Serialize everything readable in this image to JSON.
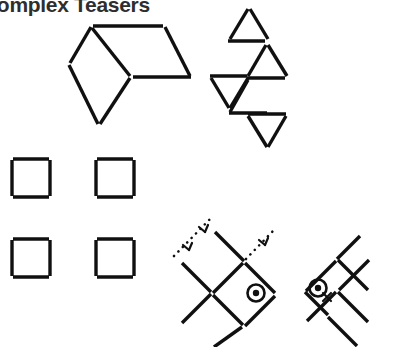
{
  "page": {
    "title": "Complex Teasers",
    "title_visible_fragment": "mplex Teasers",
    "background_color": "#ffffff",
    "ink_color": "#101010",
    "title_color": "#2e2e2e",
    "width": 397,
    "height": 347
  },
  "figures": [
    {
      "id": "figure-hexagon-diamond",
      "name": "matchstick-hexagon-diamond",
      "description": "Two adjoining rhombi forming a hexagon-like outline made of 7 matchsticks",
      "stick_count": 7,
      "sticks": [
        {
          "name": "top-horizontal",
          "x1": 93,
          "y1": 26,
          "x2": 163,
          "y2": 26
        },
        {
          "name": "upper-left-diagonal",
          "x1": 70,
          "y1": 63,
          "x2": 91,
          "y2": 27
        },
        {
          "name": "center-diagonal",
          "x1": 92,
          "y1": 28,
          "x2": 130,
          "y2": 76
        },
        {
          "name": "upper-right-diagonal",
          "x1": 165,
          "y1": 27,
          "x2": 190,
          "y2": 76
        },
        {
          "name": "middle-horizontal",
          "x1": 133,
          "y1": 77,
          "x2": 191,
          "y2": 77
        },
        {
          "name": "lower-left-diagonal",
          "x1": 69,
          "y1": 65,
          "x2": 98,
          "y2": 124
        },
        {
          "name": "lower-right-diagonal",
          "x1": 130,
          "y1": 78,
          "x2": 100,
          "y2": 124
        }
      ]
    },
    {
      "id": "figure-triangle-zigzag",
      "name": "matchstick-triangle-zigzag",
      "description": "Five triangles arranged in a descending zigzag chain",
      "triangle_count": 5,
      "sticks": [
        {
          "name": "t1-left",
          "x1": 230,
          "y1": 39,
          "x2": 248,
          "y2": 9
        },
        {
          "name": "t1-right",
          "x1": 250,
          "y1": 9,
          "x2": 268,
          "y2": 39
        },
        {
          "name": "t1-base",
          "x1": 228,
          "y1": 41,
          "x2": 265,
          "y2": 41
        },
        {
          "name": "t2-left",
          "x1": 248,
          "y1": 76,
          "x2": 266,
          "y2": 45
        },
        {
          "name": "t2-right",
          "x1": 268,
          "y1": 45,
          "x2": 287,
          "y2": 76
        },
        {
          "name": "t2-base",
          "x1": 247,
          "y1": 78,
          "x2": 285,
          "y2": 78
        },
        {
          "name": "t3-base",
          "x1": 210,
          "y1": 76,
          "x2": 248,
          "y2": 76
        },
        {
          "name": "t3-left",
          "x1": 211,
          "y1": 78,
          "x2": 229,
          "y2": 108
        },
        {
          "name": "t3-right",
          "x1": 248,
          "y1": 78,
          "x2": 230,
          "y2": 108
        },
        {
          "name": "t4-left",
          "x1": 230,
          "y1": 112,
          "x2": 248,
          "y2": 80
        },
        {
          "name": "t4-base",
          "x1": 229,
          "y1": 113,
          "x2": 267,
          "y2": 113
        },
        {
          "name": "t5-left",
          "x1": 248,
          "y1": 116,
          "x2": 267,
          "y2": 147
        },
        {
          "name": "t5-right",
          "x1": 286,
          "y1": 116,
          "x2": 268,
          "y2": 147
        },
        {
          "name": "t5-base",
          "x1": 248,
          "y1": 114,
          "x2": 286,
          "y2": 114
        }
      ]
    },
    {
      "id": "figure-four-squares",
      "name": "matchstick-four-squares",
      "description": "Four separate squares, each built from 4 matchsticks with small corner gaps",
      "square_count": 4,
      "stick_count": 16,
      "squares": [
        {
          "name": "square-top-left",
          "x": 12,
          "y": 158,
          "size": 38
        },
        {
          "name": "square-top-right",
          "x": 96,
          "y": 158,
          "size": 38
        },
        {
          "name": "square-bottom-left",
          "x": 12,
          "y": 238,
          "size": 38
        },
        {
          "name": "square-bottom-right",
          "x": 96,
          "y": 238,
          "size": 38
        }
      ]
    },
    {
      "id": "figure-lattice-dotted",
      "name": "matchstick-lattice-with-dotted-guides",
      "description": "Diagonal matchstick lattice with dotted construction guide lines, arrow ticks and a circled target marker",
      "sticks": [
        {
          "name": "guide-anchor-a",
          "x1": 182,
          "y1": 263,
          "x2": 212,
          "y2": 292
        },
        {
          "name": "lattice-1",
          "x1": 213,
          "y1": 294,
          "x2": 243,
          "y2": 264
        },
        {
          "name": "lattice-2",
          "x1": 245,
          "y1": 263,
          "x2": 275,
          "y2": 293
        },
        {
          "name": "lattice-3",
          "x1": 244,
          "y1": 262,
          "x2": 214,
          "y2": 232
        },
        {
          "name": "lattice-4",
          "x1": 212,
          "y1": 294,
          "x2": 182,
          "y2": 324
        },
        {
          "name": "lattice-5",
          "x1": 213,
          "y1": 295,
          "x2": 243,
          "y2": 325
        },
        {
          "name": "lattice-6",
          "x1": 245,
          "y1": 327,
          "x2": 275,
          "y2": 297
        },
        {
          "name": "lattice-7",
          "x1": 243,
          "y1": 327,
          "x2": 213,
          "y2": 347
        }
      ],
      "dotted_guides": [
        {
          "name": "guide-dotted-upper",
          "x1": 174,
          "y1": 255,
          "x2": 212,
          "y2": 217
        },
        {
          "name": "guide-dotted-right",
          "x1": 246,
          "y1": 258,
          "x2": 272,
          "y2": 232
        }
      ],
      "markers": [
        {
          "name": "target-marker",
          "cx": 256,
          "cy": 293,
          "r": 8.5,
          "dot_r": 3.2
        },
        {
          "name": "tick-arrow-left",
          "x": 186,
          "y": 247
        },
        {
          "name": "tick-arrow-mid",
          "x": 203,
          "y": 229
        },
        {
          "name": "tick-arrow-right",
          "x": 262,
          "y": 242
        }
      ]
    },
    {
      "id": "figure-lattice-plain",
      "name": "matchstick-lattice-with-marker",
      "description": "Diagonal matchstick lattice with a circled target marker carrying a small x tick",
      "sticks": [
        {
          "name": "lattice-1",
          "x1": 306,
          "y1": 291,
          "x2": 336,
          "y2": 261
        },
        {
          "name": "lattice-2",
          "x1": 338,
          "y1": 260,
          "x2": 368,
          "y2": 290
        },
        {
          "name": "lattice-3",
          "x1": 337,
          "y1": 259,
          "x2": 360,
          "y2": 236
        },
        {
          "name": "lattice-4",
          "x1": 305,
          "y1": 292,
          "x2": 327,
          "y2": 314
        },
        {
          "name": "lattice-5",
          "x1": 337,
          "y1": 291,
          "x2": 367,
          "y2": 321
        },
        {
          "name": "lattice-6",
          "x1": 336,
          "y1": 292,
          "x2": 306,
          "y2": 322
        },
        {
          "name": "lattice-7",
          "x1": 338,
          "y1": 290,
          "x2": 368,
          "y2": 260
        },
        {
          "name": "lattice-8",
          "x1": 327,
          "y1": 316,
          "x2": 357,
          "y2": 346
        }
      ],
      "markers": [
        {
          "name": "target-marker",
          "cx": 318,
          "cy": 288,
          "r": 8.5,
          "dot_r": 3.2
        },
        {
          "name": "tick-x",
          "x": 327,
          "y": 296
        }
      ]
    }
  ]
}
